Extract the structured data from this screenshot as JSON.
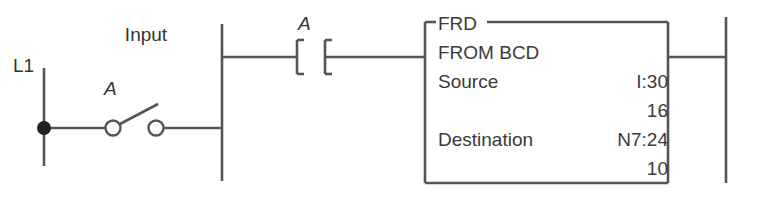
{
  "diagram": {
    "type": "ladder-logic-rung",
    "line_color": "#555555",
    "text_color": "#333333",
    "background": "#ffffff"
  },
  "field_wiring": {
    "supply_label": "L1",
    "device_label": "Input",
    "switch_label": "A",
    "switch_type": "normally-open-spst"
  },
  "rung": {
    "contact_label": "A",
    "contact_type": "normally-open"
  },
  "instruction_block": {
    "mnemonic": "FRD",
    "name": "FROM BCD",
    "rows": [
      {
        "label": "Source",
        "value": "I:30",
        "sub_value": "16"
      },
      {
        "label": "Destination",
        "value": "N7:24",
        "sub_value": "10"
      }
    ]
  }
}
